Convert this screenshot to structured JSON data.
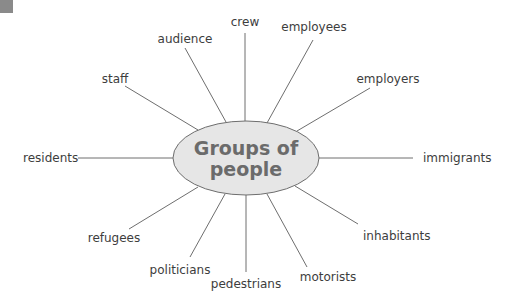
{
  "diagram": {
    "type": "spider-diagram",
    "hub": {
      "line1": "Groups of",
      "line2": "people",
      "center": [
        246,
        158
      ],
      "rx": 73,
      "ry": 37,
      "fill": "#e6e6e6",
      "stroke": "#6e6e6e",
      "text_color": "#6b6b6b"
    },
    "spokes": [
      {
        "label": "crew",
        "label_x": 245,
        "label_y": 26,
        "anchor": "middle",
        "line": [
          245,
          33,
          245,
          121
        ]
      },
      {
        "label": "employees",
        "label_x": 314,
        "label_y": 31,
        "anchor": "middle",
        "line": [
          313,
          40,
          267,
          123
        ]
      },
      {
        "label": "employers",
        "label_x": 388,
        "label_y": 83,
        "anchor": "middle",
        "line": [
          370,
          88,
          297,
          131
        ]
      },
      {
        "label": "immigrants",
        "label_x": 423,
        "label_y": 162,
        "anchor": "start",
        "line": [
          319,
          158,
          413,
          158
        ]
      },
      {
        "label": "inhabitants",
        "label_x": 363,
        "label_y": 240,
        "anchor": "start",
        "line": [
          295,
          186,
          358,
          224
        ]
      },
      {
        "label": "motorists",
        "label_x": 328,
        "label_y": 281,
        "anchor": "middle",
        "line": [
          267,
          194,
          307,
          267
        ]
      },
      {
        "label": "pedestrians",
        "label_x": 246,
        "label_y": 288,
        "anchor": "middle",
        "line": [
          246,
          195,
          246,
          272
        ]
      },
      {
        "label": "politicians",
        "label_x": 180,
        "label_y": 274,
        "anchor": "middle",
        "line": [
          225,
          194,
          190,
          257
        ]
      },
      {
        "label": "refugees",
        "label_x": 114,
        "label_y": 242,
        "anchor": "middle",
        "line": [
          198,
          187,
          129,
          229
        ]
      },
      {
        "label": "residents",
        "label_x": 23,
        "label_y": 162,
        "anchor": "start",
        "line": [
          78,
          158,
          173,
          158
        ]
      },
      {
        "label": "staff",
        "label_x": 115,
        "label_y": 83,
        "anchor": "middle",
        "line": [
          125,
          86,
          198,
          130
        ]
      },
      {
        "label": "audience",
        "label_x": 185,
        "label_y": 43,
        "anchor": "middle",
        "line": [
          185,
          48,
          226,
          122
        ]
      }
    ],
    "line_color": "#6e6e6e",
    "label_color": "#3d3d3d"
  }
}
